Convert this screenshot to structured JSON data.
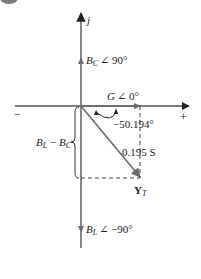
{
  "diagram": {
    "type": "admittance-phasor-diagram",
    "axes": {
      "vertical_label": "j",
      "positive_label": "+",
      "negative_label": "−"
    },
    "phasors": {
      "bc": {
        "symbol": "B",
        "subscript": "C",
        "angle_text": "∠ 90°"
      },
      "g": {
        "symbol": "G",
        "angle_text": "∠ 0°"
      },
      "bl": {
        "symbol": "B",
        "subscript": "L",
        "angle_text": "∠ −90°"
      },
      "yt": {
        "symbol": "Y",
        "subscript": "T",
        "magnitude_text": "0.195 S",
        "angle_text": "−50.194°"
      }
    },
    "brace_label": {
      "b1": "B",
      "s1": "L",
      "minus": " − ",
      "b2": "B",
      "s2": "C"
    },
    "colors": {
      "axis": "#555555",
      "phasor": "#6b6b6b",
      "arrowhead": "#333333",
      "dashed": "#444444",
      "text": "#222222"
    }
  }
}
